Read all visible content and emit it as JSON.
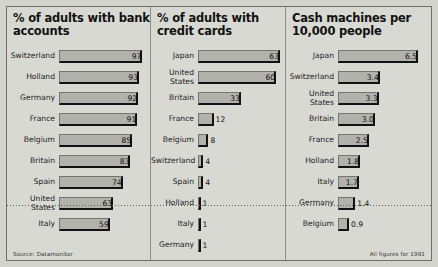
{
  "footer": {
    "source": "Source: Datamonitor",
    "note": "All figures for 1991"
  },
  "chart_data": [
    {
      "type": "bar",
      "title": "% of adults with bank accounts",
      "orientation": "horizontal",
      "xlabel": "",
      "ylabel": "",
      "xlim": [
        0,
        100
      ],
      "grid": false,
      "legend": "none",
      "categories": [
        "Switzerland",
        "Holland",
        "Germany",
        "France",
        "Belgium",
        "Britain",
        "Spain",
        "United States",
        "Italy"
      ],
      "values": [
        97,
        93,
        92,
        91,
        85,
        83,
        74,
        63,
        59
      ],
      "labels": [
        "97",
        "93",
        "92",
        "91",
        "85",
        "83",
        "74",
        "63",
        "59"
      ]
    },
    {
      "type": "bar",
      "title": "% of adults with credit cards",
      "orientation": "horizontal",
      "xlabel": "",
      "ylabel": "",
      "xlim": [
        0,
        63
      ],
      "grid": false,
      "legend": "none",
      "categories": [
        "Japan",
        "United States",
        "Britain",
        "France",
        "Belgium",
        "Switzerland",
        "Spain",
        "Holland",
        "Italy",
        "Germany"
      ],
      "values": [
        63,
        60,
        33,
        12,
        8,
        4,
        4,
        1,
        1,
        1
      ],
      "labels": [
        "63",
        "60",
        "33",
        "12",
        "8",
        "4",
        "4",
        "1",
        "1",
        "1"
      ]
    },
    {
      "type": "bar",
      "title": "Cash machines per 10,000 people",
      "orientation": "horizontal",
      "xlabel": "",
      "ylabel": "",
      "xlim": [
        0,
        6.5
      ],
      "grid": false,
      "legend": "none",
      "categories": [
        "Japan",
        "Switzerland",
        "United States",
        "Britain",
        "France",
        "Holland",
        "Italy",
        "Germany",
        "Belgium"
      ],
      "values": [
        6.5,
        3.4,
        3.3,
        3.0,
        2.5,
        1.8,
        1.7,
        1.4,
        0.9
      ],
      "labels": [
        "6.5",
        "3.4",
        "3.3",
        "3.0",
        "2.5",
        "1.8",
        "1.7",
        "1.4",
        "0.9"
      ]
    }
  ]
}
